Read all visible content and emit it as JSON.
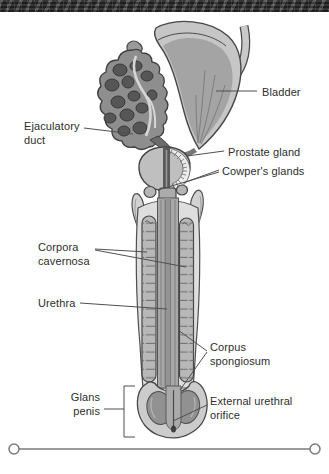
{
  "figure": {
    "type": "anatomical-diagram",
    "colors": {
      "outline": "#474747",
      "leader_line": "#4f4f4f",
      "label_text": "#2e2e2e",
      "top_banner": "#3c3c3c",
      "bottom_rule": "#7a7a7a",
      "light_gray_fill": "#dedede",
      "mid_gray_fill": "#a8a8a8",
      "dark_gray_fill": "#565656"
    },
    "labels": {
      "bladder": "Bladder",
      "ejaculatory_duct": "Ejaculatory duct",
      "prostate_gland": "Prostate gland",
      "cowpers_glands": "Cowper's glands",
      "corpora_cavernosa": "Corpora cavernosa",
      "urethra": "Urethra",
      "corpus_spongiosum": "Corpus spongiosum",
      "glans_penis": "Glans penis",
      "external_urethral_orifice": "External urethral orifice"
    }
  }
}
